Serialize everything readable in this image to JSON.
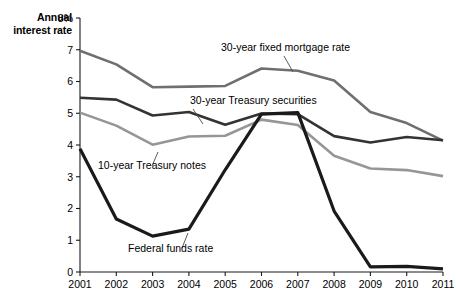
{
  "axis_title": {
    "line1": "Annual",
    "line2": "interest rate",
    "unit": "8%"
  },
  "chart_data": {
    "type": "line",
    "title": "",
    "subtitle": "",
    "xlabel": "",
    "ylabel": "Annual interest rate",
    "yunit": "%",
    "grid": false,
    "legend_position": "inline-annotations",
    "xlim": [
      2001,
      2011
    ],
    "ylim": [
      0,
      8
    ],
    "yticks": [
      0,
      1,
      2,
      3,
      4,
      5,
      6,
      7,
      8
    ],
    "ytick_labels": [
      "0",
      "1",
      "2",
      "3",
      "4",
      "5",
      "6",
      "7",
      "8%"
    ],
    "categories": [
      2001,
      2002,
      2003,
      2004,
      2005,
      2006,
      2007,
      2008,
      2009,
      2010,
      2011
    ],
    "xtick_labels": [
      "2001",
      "2002",
      "2003",
      "2004",
      "2005",
      "2006",
      "2007",
      "2008",
      "2009",
      "2010",
      "2011"
    ],
    "series": [
      {
        "name": "30-year fixed mortgage rate",
        "color": "#6f6f6f",
        "width": 2.6,
        "values": [
          6.97,
          6.54,
          5.82,
          5.84,
          5.86,
          6.41,
          6.34,
          6.03,
          5.04,
          4.69,
          4.14
        ]
      },
      {
        "name": "30-year Treasury securities",
        "color": "#333333",
        "width": 2.6,
        "values": [
          5.49,
          5.43,
          4.93,
          5.04,
          4.64,
          4.99,
          4.97,
          4.28,
          4.08,
          4.25,
          4.15
        ]
      },
      {
        "name": "10-year Treasury notes",
        "color": "#969696",
        "width": 2.6,
        "values": [
          5.02,
          4.61,
          4.01,
          4.27,
          4.29,
          4.8,
          4.63,
          3.66,
          3.26,
          3.21,
          3.02
        ]
      },
      {
        "name": "Federal funds rate",
        "color": "#1a1a1a",
        "width": 3.2,
        "values": [
          3.88,
          1.67,
          1.13,
          1.35,
          3.22,
          4.97,
          5.02,
          1.92,
          0.16,
          0.18,
          0.1
        ]
      }
    ],
    "annotations": [
      {
        "text": "30-year fixed mortgage rate",
        "series": "30-year fixed mortgage rate",
        "text_x": 221,
        "text_y": 51,
        "leader": [
          [
            284,
            56
          ],
          [
            293,
            72
          ]
        ]
      },
      {
        "text": "30-year Treasury securities",
        "series": "30-year Treasury securities",
        "text_x": 190,
        "text_y": 104,
        "leader": [
          [
            193,
            109
          ],
          [
            203,
            124
          ]
        ]
      },
      {
        "text": "10-year Treasury notes",
        "series": "10-year Treasury notes",
        "text_x": 98,
        "text_y": 169,
        "leader": [
          [
            152,
            166
          ],
          [
            158,
            152
          ]
        ]
      },
      {
        "text": "Federal funds rate",
        "series": "Federal funds rate",
        "text_x": 128,
        "text_y": 252,
        "leader": [
          [
            182,
            248
          ],
          [
            188,
            233
          ]
        ]
      }
    ]
  }
}
